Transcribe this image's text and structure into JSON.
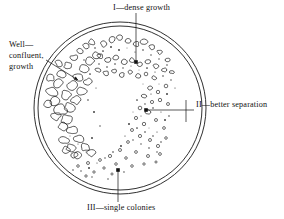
{
  "figure": {
    "background_color": "#ffffff",
    "ink_color": "#111111"
  },
  "dish": {
    "name": "petri-dish",
    "center_x": 120,
    "center_y": 108,
    "outer_radius": 86,
    "inner_radius": 82,
    "rim_color": "#1a1a1a"
  },
  "labels": {
    "dense": "I—dense growth",
    "separation": "II—better separation",
    "single": "III—single colonies",
    "well_line1": "Well—",
    "well_line2": "confluent,",
    "well_line3": "growth"
  },
  "leaders": {
    "dense": {
      "x1": 136,
      "y1": 13,
      "x2": 136,
      "y2": 62
    },
    "separation": {
      "x1": 194,
      "y1": 110,
      "x2": 146,
      "y2": 110,
      "tick_x": 186,
      "tick_y1": 100,
      "tick_y2": 122
    },
    "single": {
      "x1": 118,
      "y1": 202,
      "x2": 118,
      "y2": 170
    },
    "well": {
      "x1": 46,
      "y1": 60,
      "x2": 78,
      "y2": 80
    }
  },
  "chart_data": {
    "type": "scatter",
    "regions": [
      {
        "id": "I",
        "name": "dense growth",
        "description": "confluent overlapping colonies, first streak",
        "colony_count": 120,
        "colony_size": "large"
      },
      {
        "id": "II",
        "name": "better separation",
        "description": "smaller, more spaced colonies, second streak",
        "colony_count": 70,
        "colony_size": "medium"
      },
      {
        "id": "III",
        "name": "single colonies",
        "description": "isolated individual colonies, final streak",
        "colony_count": 30,
        "colony_size": "small"
      }
    ],
    "colonies": [
      {
        "x": 52,
        "y": 92,
        "r": 5.1,
        "f": 0
      },
      {
        "x": 58,
        "y": 83,
        "r": 4.4,
        "f": 0
      },
      {
        "x": 55,
        "y": 101,
        "r": 4.8,
        "f": 0
      },
      {
        "x": 62,
        "y": 74,
        "r": 4.0,
        "f": 0
      },
      {
        "x": 61,
        "y": 110,
        "r": 5.4,
        "f": 0
      },
      {
        "x": 66,
        "y": 95,
        "r": 4.6,
        "f": 0
      },
      {
        "x": 68,
        "y": 66,
        "r": 3.7,
        "f": 0
      },
      {
        "x": 67,
        "y": 120,
        "r": 5.0,
        "f": 0
      },
      {
        "x": 72,
        "y": 86,
        "r": 4.9,
        "f": 0
      },
      {
        "x": 74,
        "y": 58,
        "r": 3.4,
        "f": 0
      },
      {
        "x": 73,
        "y": 130,
        "r": 4.7,
        "f": 0
      },
      {
        "x": 78,
        "y": 77,
        "r": 4.3,
        "f": 0
      },
      {
        "x": 80,
        "y": 51,
        "r": 3.2,
        "f": 0
      },
      {
        "x": 79,
        "y": 139,
        "r": 4.4,
        "f": 0
      },
      {
        "x": 84,
        "y": 69,
        "r": 4.1,
        "f": 0
      },
      {
        "x": 86,
        "y": 46,
        "r": 3.0,
        "f": 0
      },
      {
        "x": 85,
        "y": 147,
        "r": 4.0,
        "f": 0
      },
      {
        "x": 90,
        "y": 61,
        "r": 3.8,
        "f": 0
      },
      {
        "x": 92,
        "y": 42,
        "r": 2.8,
        "f": 0
      },
      {
        "x": 91,
        "y": 153,
        "r": 3.6,
        "f": 0
      },
      {
        "x": 96,
        "y": 55,
        "r": 3.4,
        "f": 0
      },
      {
        "x": 56,
        "y": 116,
        "r": 4.2,
        "f": 0
      },
      {
        "x": 63,
        "y": 126,
        "r": 4.5,
        "f": 0
      },
      {
        "x": 70,
        "y": 107,
        "r": 4.6,
        "f": 0
      },
      {
        "x": 76,
        "y": 100,
        "r": 4.2,
        "f": 0
      },
      {
        "x": 82,
        "y": 91,
        "r": 3.9,
        "f": 0
      },
      {
        "x": 88,
        "y": 82,
        "r": 3.6,
        "f": 0
      },
      {
        "x": 64,
        "y": 140,
        "r": 4.1,
        "f": 0
      },
      {
        "x": 71,
        "y": 148,
        "r": 3.8,
        "f": 0
      },
      {
        "x": 78,
        "y": 155,
        "r": 3.4,
        "f": 0
      },
      {
        "x": 50,
        "y": 78,
        "r": 3.6,
        "f": 0
      },
      {
        "x": 48,
        "y": 104,
        "r": 3.5,
        "f": 0
      },
      {
        "x": 59,
        "y": 63,
        "r": 3.3,
        "f": 0
      },
      {
        "x": 104,
        "y": 44,
        "r": 2.9,
        "f": 0
      },
      {
        "x": 112,
        "y": 40,
        "r": 3.1,
        "f": 0
      },
      {
        "x": 120,
        "y": 38,
        "r": 2.7,
        "f": 0
      },
      {
        "x": 128,
        "y": 41,
        "r": 3.0,
        "f": 0
      },
      {
        "x": 136,
        "y": 44,
        "r": 2.6,
        "f": 0
      },
      {
        "x": 144,
        "y": 42,
        "r": 2.8,
        "f": 0
      },
      {
        "x": 152,
        "y": 47,
        "r": 2.5,
        "f": 0
      },
      {
        "x": 160,
        "y": 52,
        "r": 2.4,
        "f": 0
      },
      {
        "x": 168,
        "y": 60,
        "r": 2.2,
        "f": 0
      },
      {
        "x": 100,
        "y": 56,
        "r": 2.6,
        "f": 0
      },
      {
        "x": 108,
        "y": 60,
        "r": 2.8,
        "f": 0
      },
      {
        "x": 116,
        "y": 58,
        "r": 2.4,
        "f": 0
      },
      {
        "x": 124,
        "y": 62,
        "r": 2.7,
        "f": 0
      },
      {
        "x": 132,
        "y": 60,
        "r": 2.3,
        "f": 0
      },
      {
        "x": 140,
        "y": 64,
        "r": 2.5,
        "f": 0
      },
      {
        "x": 148,
        "y": 62,
        "r": 2.2,
        "f": 0
      },
      {
        "x": 156,
        "y": 66,
        "r": 2.4,
        "f": 0
      },
      {
        "x": 164,
        "y": 70,
        "r": 2.1,
        "f": 0
      },
      {
        "x": 98,
        "y": 70,
        "r": 2.3,
        "f": 0
      },
      {
        "x": 106,
        "y": 73,
        "r": 2.5,
        "f": 0
      },
      {
        "x": 114,
        "y": 71,
        "r": 2.0,
        "f": 0
      },
      {
        "x": 122,
        "y": 75,
        "r": 2.2,
        "f": 0
      },
      {
        "x": 130,
        "y": 72,
        "r": 1.9,
        "f": 0
      },
      {
        "x": 138,
        "y": 76,
        "r": 2.1,
        "f": 0
      },
      {
        "x": 146,
        "y": 74,
        "r": 1.8,
        "f": 0
      },
      {
        "x": 154,
        "y": 78,
        "r": 2.0,
        "f": 0
      },
      {
        "x": 172,
        "y": 72,
        "r": 1.9,
        "f": 0
      },
      {
        "x": 150,
        "y": 88,
        "r": 1.9,
        "f": 0
      },
      {
        "x": 158,
        "y": 92,
        "r": 1.7,
        "f": 0
      },
      {
        "x": 166,
        "y": 86,
        "r": 1.8,
        "f": 0
      },
      {
        "x": 144,
        "y": 96,
        "r": 2.0,
        "f": 0
      },
      {
        "x": 152,
        "y": 102,
        "r": 1.6,
        "f": 0
      },
      {
        "x": 160,
        "y": 100,
        "r": 1.7,
        "f": 0
      },
      {
        "x": 140,
        "y": 108,
        "r": 1.8,
        "f": 0
      },
      {
        "x": 148,
        "y": 112,
        "r": 2.4,
        "f": 0
      },
      {
        "x": 168,
        "y": 104,
        "r": 1.5,
        "f": 0
      },
      {
        "x": 136,
        "y": 118,
        "r": 1.6,
        "f": 0
      },
      {
        "x": 144,
        "y": 124,
        "r": 1.7,
        "f": 0
      },
      {
        "x": 156,
        "y": 120,
        "r": 1.5,
        "f": 0
      },
      {
        "x": 132,
        "y": 130,
        "r": 1.5,
        "f": 0
      },
      {
        "x": 140,
        "y": 136,
        "r": 1.6,
        "f": 0
      },
      {
        "x": 164,
        "y": 128,
        "r": 1.4,
        "f": 0
      },
      {
        "x": 128,
        "y": 142,
        "r": 1.4,
        "f": 0
      },
      {
        "x": 150,
        "y": 140,
        "r": 1.5,
        "f": 0
      },
      {
        "x": 158,
        "y": 146,
        "r": 1.6,
        "f": 0
      },
      {
        "x": 120,
        "y": 150,
        "r": 1.5,
        "f": 0
      },
      {
        "x": 136,
        "y": 152,
        "r": 1.4,
        "f": 0
      },
      {
        "x": 166,
        "y": 138,
        "r": 1.3,
        "f": 0
      },
      {
        "x": 110,
        "y": 156,
        "r": 1.6,
        "f": 0
      },
      {
        "x": 126,
        "y": 158,
        "r": 1.3,
        "f": 0
      },
      {
        "x": 148,
        "y": 156,
        "r": 1.5,
        "f": 0
      },
      {
        "x": 100,
        "y": 160,
        "r": 1.4,
        "f": 0
      },
      {
        "x": 116,
        "y": 164,
        "r": 1.3,
        "f": 0
      },
      {
        "x": 160,
        "y": 154,
        "r": 1.4,
        "f": 0
      },
      {
        "x": 88,
        "y": 163,
        "r": 1.5,
        "f": 0
      },
      {
        "x": 104,
        "y": 168,
        "r": 1.2,
        "f": 0
      },
      {
        "x": 132,
        "y": 166,
        "r": 1.3,
        "f": 0
      },
      {
        "x": 78,
        "y": 166,
        "r": 1.3,
        "f": 0
      },
      {
        "x": 94,
        "y": 172,
        "r": 1.2,
        "f": 0
      },
      {
        "x": 144,
        "y": 164,
        "r": 1.2,
        "f": 0
      },
      {
        "x": 86,
        "y": 176,
        "r": 1.2,
        "f": 0
      },
      {
        "x": 112,
        "y": 174,
        "r": 1.1,
        "f": 0
      },
      {
        "x": 156,
        "y": 162,
        "r": 1.1,
        "f": 0
      },
      {
        "x": 74,
        "y": 155,
        "r": 3.2,
        "f": 0
      },
      {
        "x": 66,
        "y": 150,
        "r": 3.4,
        "f": 0
      },
      {
        "x": 118,
        "y": 170,
        "r": 1.8,
        "f": 1
      },
      {
        "x": 146,
        "y": 110,
        "r": 1.8,
        "f": 1
      },
      {
        "x": 136,
        "y": 62,
        "r": 1.8,
        "f": 1
      }
    ],
    "speckles": [
      {
        "x": 95,
        "y": 48
      },
      {
        "x": 103,
        "y": 51
      },
      {
        "x": 111,
        "y": 47
      },
      {
        "x": 119,
        "y": 50
      },
      {
        "x": 127,
        "y": 48
      },
      {
        "x": 135,
        "y": 52
      },
      {
        "x": 143,
        "y": 50
      },
      {
        "x": 151,
        "y": 55
      },
      {
        "x": 159,
        "y": 59
      },
      {
        "x": 167,
        "y": 65
      },
      {
        "x": 99,
        "y": 64
      },
      {
        "x": 107,
        "y": 67
      },
      {
        "x": 115,
        "y": 64
      },
      {
        "x": 123,
        "y": 68
      },
      {
        "x": 131,
        "y": 66
      },
      {
        "x": 139,
        "y": 70
      },
      {
        "x": 147,
        "y": 68
      },
      {
        "x": 155,
        "y": 72
      },
      {
        "x": 163,
        "y": 76
      },
      {
        "x": 171,
        "y": 80
      },
      {
        "x": 143,
        "y": 84
      },
      {
        "x": 151,
        "y": 94
      },
      {
        "x": 159,
        "y": 84
      },
      {
        "x": 167,
        "y": 94
      },
      {
        "x": 175,
        "y": 88
      },
      {
        "x": 137,
        "y": 100
      },
      {
        "x": 145,
        "y": 104
      },
      {
        "x": 153,
        "y": 108
      },
      {
        "x": 161,
        "y": 112
      },
      {
        "x": 169,
        "y": 116
      },
      {
        "x": 133,
        "y": 112
      },
      {
        "x": 141,
        "y": 116
      },
      {
        "x": 149,
        "y": 128
      },
      {
        "x": 157,
        "y": 132
      },
      {
        "x": 165,
        "y": 120
      },
      {
        "x": 129,
        "y": 124
      },
      {
        "x": 137,
        "y": 128
      },
      {
        "x": 145,
        "y": 132
      },
      {
        "x": 153,
        "y": 136
      },
      {
        "x": 161,
        "y": 142
      },
      {
        "x": 125,
        "y": 136
      },
      {
        "x": 133,
        "y": 140
      },
      {
        "x": 141,
        "y": 144
      },
      {
        "x": 149,
        "y": 148
      },
      {
        "x": 157,
        "y": 152
      },
      {
        "x": 121,
        "y": 146
      },
      {
        "x": 113,
        "y": 152
      },
      {
        "x": 105,
        "y": 158
      },
      {
        "x": 97,
        "y": 163
      },
      {
        "x": 89,
        "y": 168
      },
      {
        "x": 81,
        "y": 171
      },
      {
        "x": 73,
        "y": 170
      },
      {
        "x": 92,
        "y": 177
      },
      {
        "x": 108,
        "y": 179
      },
      {
        "x": 124,
        "y": 172
      },
      {
        "x": 84,
        "y": 60
      },
      {
        "x": 90,
        "y": 74
      },
      {
        "x": 96,
        "y": 88
      },
      {
        "x": 88,
        "y": 100
      },
      {
        "x": 94,
        "y": 112
      },
      {
        "x": 100,
        "y": 126
      },
      {
        "x": 92,
        "y": 138
      },
      {
        "x": 86,
        "y": 152
      },
      {
        "x": 78,
        "y": 144
      },
      {
        "x": 70,
        "y": 136
      }
    ]
  }
}
